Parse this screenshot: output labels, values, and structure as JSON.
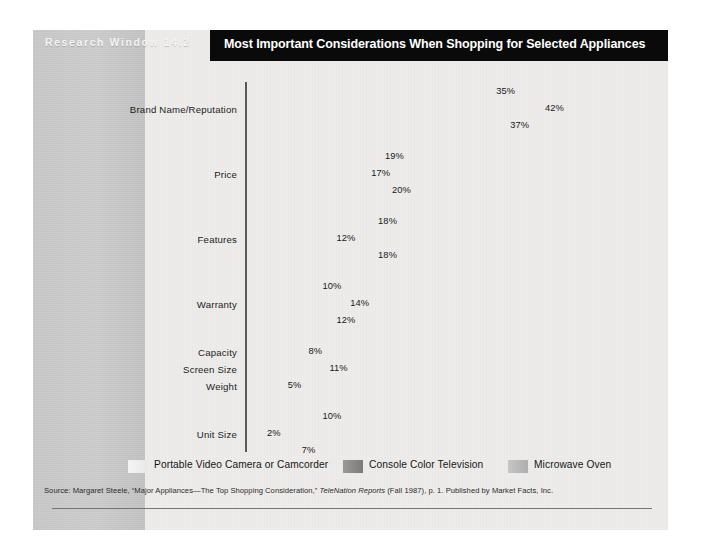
{
  "exhibit": {
    "label": "Research Window 14.2",
    "title": "Most Important Considerations When Shopping for Selected Appliances"
  },
  "colors": {
    "title_bar_bg": "#0a0a0a",
    "title_bar_text": "#ffffff",
    "left_band": "#c9c9c9",
    "sheet_bg": "#eeedeb",
    "series_camcorder": "#e8e8e8",
    "series_television": "#7a7a7a",
    "series_microwave": "#b4b4b4",
    "axis": "#5a5a5a"
  },
  "legend": {
    "items": [
      {
        "label": "Portable Video Camera or Camcorder",
        "swatch": "s0"
      },
      {
        "label": "Console Color Television",
        "swatch": "s1"
      },
      {
        "label": "Microwave Oven",
        "swatch": "s2"
      }
    ]
  },
  "source": {
    "prefix": "Source: Margaret Steele, “Major Appliances—The Top Shopping Consideration,” ",
    "italic": "TeleNation Reports",
    "suffix": " (Fall 1987), p. 1. Published by Market Facts, Inc."
  },
  "chart_data": {
    "type": "bar",
    "orientation": "horizontal",
    "title": "Most Important Considerations When Shopping for Selected Appliances",
    "xlabel": "",
    "ylabel": "",
    "xlim": [
      0,
      42
    ],
    "grid": false,
    "legend_position": "bottom",
    "value_suffix": "%",
    "series": [
      {
        "name": "Microwave Oven",
        "style": "s0"
      },
      {
        "name": "Console Color Television",
        "style": "s1"
      },
      {
        "name": "Portable Video Camera or Camcorder",
        "style": "s2"
      }
    ],
    "groups": [
      {
        "labels": [
          "Brand Name/Reputation"
        ],
        "bars": [
          {
            "value": 35,
            "label": "35%",
            "style": "s0"
          },
          {
            "value": 42,
            "label": "42%",
            "style": "s1"
          },
          {
            "value": 37,
            "label": "37%",
            "style": "s2"
          }
        ]
      },
      {
        "labels": [
          "Price"
        ],
        "bars": [
          {
            "value": 19,
            "label": "19%",
            "style": "s0"
          },
          {
            "value": 17,
            "label": "17%",
            "style": "s1"
          },
          {
            "value": 20,
            "label": "20%",
            "style": "s2"
          }
        ]
      },
      {
        "labels": [
          "Features"
        ],
        "bars": [
          {
            "value": 18,
            "label": "18%",
            "style": "s0"
          },
          {
            "value": 12,
            "label": "12%",
            "style": "s1"
          },
          {
            "value": 18,
            "label": "18%",
            "style": "s2"
          }
        ]
      },
      {
        "labels": [
          "Warranty"
        ],
        "bars": [
          {
            "value": 10,
            "label": "10%",
            "style": "s0"
          },
          {
            "value": 14,
            "label": "14%",
            "style": "s1"
          },
          {
            "value": 12,
            "label": "12%",
            "style": "s2"
          }
        ]
      },
      {
        "labels": [
          "Capacity",
          "Screen Size",
          "Weight"
        ],
        "bars": [
          {
            "value": 8,
            "label": "8%",
            "style": "s0"
          },
          {
            "value": 11,
            "label": "11%",
            "style": "s1"
          },
          {
            "value": 5,
            "label": "5%",
            "style": "s2"
          }
        ]
      },
      {
        "labels": [
          "Unit Size"
        ],
        "bars": [
          {
            "value": 10,
            "label": "10%",
            "style": "s0"
          },
          {
            "value": 2,
            "label": "2%",
            "style": "s1"
          },
          {
            "value": 7,
            "label": "7%",
            "style": "s2"
          }
        ]
      }
    ]
  }
}
